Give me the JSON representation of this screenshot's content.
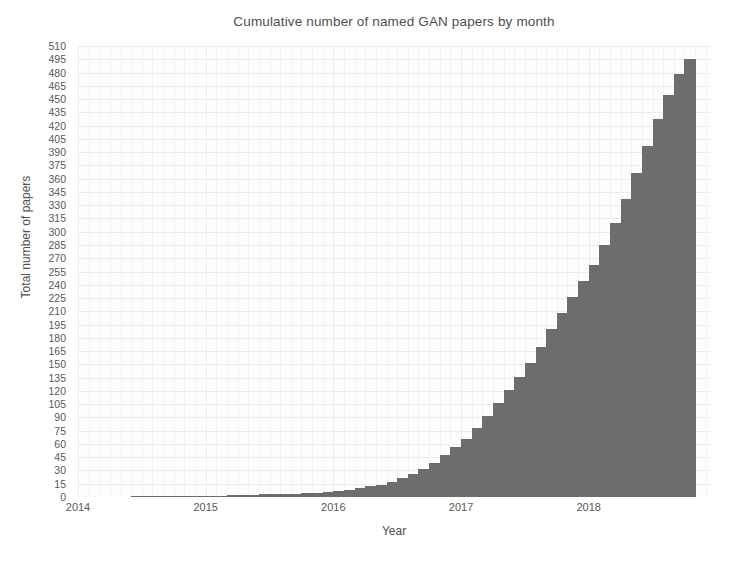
{
  "chart_data": {
    "type": "bar",
    "title": "Cumulative number of named GAN papers by month",
    "xlabel": "Year",
    "ylabel": "Total number of papers",
    "grid": true,
    "legend": null,
    "xlim": [
      2014.0,
      2018.95
    ],
    "ylim": [
      0,
      510
    ],
    "y_ticks": [
      0,
      15,
      30,
      45,
      60,
      75,
      90,
      105,
      120,
      135,
      150,
      165,
      180,
      195,
      210,
      225,
      240,
      255,
      270,
      285,
      300,
      315,
      330,
      345,
      360,
      375,
      390,
      405,
      420,
      435,
      450,
      465,
      480,
      495,
      510
    ],
    "x_ticks": [
      2014,
      2015,
      2016,
      2017,
      2018
    ],
    "x_tick_labels": [
      "2014",
      "2015",
      "2016",
      "2017",
      "2018"
    ],
    "bar_color": "#6d6d6d",
    "background_color": "#fdfdfd",
    "grid_color": "#ebebeb",
    "categories": [
      "2014-01",
      "2014-02",
      "2014-03",
      "2014-04",
      "2014-05",
      "2014-06",
      "2014-07",
      "2014-08",
      "2014-09",
      "2014-10",
      "2014-11",
      "2014-12",
      "2015-01",
      "2015-02",
      "2015-03",
      "2015-04",
      "2015-05",
      "2015-06",
      "2015-07",
      "2015-08",
      "2015-09",
      "2015-10",
      "2015-11",
      "2015-12",
      "2016-01",
      "2016-02",
      "2016-03",
      "2016-04",
      "2016-05",
      "2016-06",
      "2016-07",
      "2016-08",
      "2016-09",
      "2016-10",
      "2016-11",
      "2016-12",
      "2017-01",
      "2017-02",
      "2017-03",
      "2017-04",
      "2017-05",
      "2017-06",
      "2017-07",
      "2017-08",
      "2017-09",
      "2017-10",
      "2017-11",
      "2017-12",
      "2018-01",
      "2018-02",
      "2018-03",
      "2018-04",
      "2018-05",
      "2018-06",
      "2018-07",
      "2018-08",
      "2018-09",
      "2018-10"
    ],
    "values": [
      0,
      0,
      0,
      0,
      0,
      1,
      1,
      1,
      1,
      1,
      1,
      1,
      1,
      1,
      2,
      2,
      2,
      3,
      3,
      3,
      3,
      4,
      5,
      6,
      7,
      8,
      10,
      12,
      14,
      17,
      21,
      26,
      32,
      39,
      47,
      56,
      66,
      78,
      92,
      106,
      121,
      136,
      152,
      170,
      190,
      208,
      226,
      244,
      262,
      285,
      310,
      337,
      366,
      397,
      428,
      455,
      478,
      495
    ]
  }
}
